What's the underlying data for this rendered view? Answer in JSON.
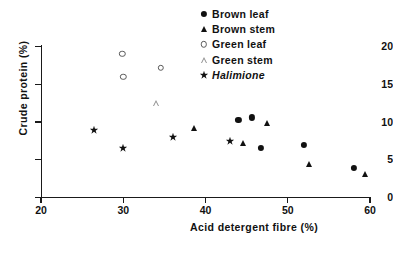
{
  "chart_data": {
    "type": "scatter",
    "title": "",
    "xlabel": "Acid detergent fibre (%)",
    "ylabel": "Crude protein (%)",
    "xlim": [
      20,
      60
    ],
    "ylim": [
      0,
      20
    ],
    "xticks": [
      20,
      30,
      40,
      50,
      60
    ],
    "yticks": [
      0,
      5,
      10,
      15,
      20
    ],
    "grid": false,
    "legend_position": "top-right",
    "series": [
      {
        "name": "Brown leaf",
        "marker": "filled-circle",
        "color": "#111111",
        "points": [
          {
            "x": 44.0,
            "y": 10.3
          },
          {
            "x": 45.6,
            "y": 10.6
          },
          {
            "x": 46.7,
            "y": 6.6
          },
          {
            "x": 52.0,
            "y": 7.0
          },
          {
            "x": 58.0,
            "y": 3.9
          }
        ]
      },
      {
        "name": "Brown stem",
        "marker": "filled-triangle",
        "color": "#111111",
        "points": [
          {
            "x": 38.6,
            "y": 9.2
          },
          {
            "x": 44.6,
            "y": 7.2
          },
          {
            "x": 47.5,
            "y": 9.9
          },
          {
            "x": 52.6,
            "y": 4.5
          },
          {
            "x": 59.4,
            "y": 3.1
          }
        ]
      },
      {
        "name": "Green leaf",
        "marker": "open-circle",
        "color": "#5a5a5a",
        "points": [
          {
            "x": 29.9,
            "y": 19.0
          },
          {
            "x": 30.0,
            "y": 16.0
          },
          {
            "x": 34.6,
            "y": 17.2
          }
        ]
      },
      {
        "name": "Green stem",
        "marker": "open-triangle",
        "color": "#8e8e8e",
        "points": [
          {
            "x": 34.0,
            "y": 12.5
          }
        ]
      },
      {
        "name": "Halimione",
        "marker": "star",
        "color": "#111111",
        "italic": true,
        "points": [
          {
            "x": 26.5,
            "y": 9.0
          },
          {
            "x": 30.0,
            "y": 6.5
          },
          {
            "x": 36.0,
            "y": 8.0
          },
          {
            "x": 43.0,
            "y": 7.5
          }
        ]
      }
    ]
  },
  "legend": {
    "items": [
      {
        "label": "Brown leaf",
        "marker": "filled-circle",
        "italic": false
      },
      {
        "label": "Brown stem",
        "marker": "filled-triangle",
        "italic": false
      },
      {
        "label": "Green leaf",
        "marker": "open-circle",
        "italic": false
      },
      {
        "label": "Green stem",
        "marker": "open-triangle",
        "italic": false
      },
      {
        "label": "Halimione",
        "marker": "star",
        "italic": true
      }
    ]
  },
  "axes": {
    "x_tick_labels": [
      "20",
      "30",
      "40",
      "50",
      "60"
    ],
    "y_tick_labels": [
      "0",
      "5",
      "10",
      "15",
      "20"
    ]
  }
}
